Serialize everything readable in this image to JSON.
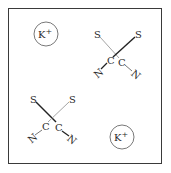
{
  "figure": {
    "frame": {
      "stroke": "#3a3a3a"
    },
    "ions": [
      {
        "label": "K",
        "charge": "+",
        "cx": 46,
        "cy": 34,
        "r": 12
      },
      {
        "label": "K",
        "charge": "+",
        "cx": 122,
        "cy": 137,
        "r": 12
      }
    ],
    "molecules": [
      {
        "name": "thiocyanate-top-right",
        "atoms": {
          "S_left": {
            "label": "S",
            "x": 97,
            "y": 34
          },
          "S_right": {
            "label": "S",
            "x": 138,
            "y": 34
          },
          "C_left": {
            "label": "C",
            "x": 110,
            "y": 60
          },
          "C_right": {
            "label": "C",
            "x": 121,
            "y": 62
          },
          "N_left": {
            "label": "N",
            "x": 98,
            "y": 73
          },
          "N_right": {
            "label": "N",
            "x": 136,
            "y": 74
          }
        }
      },
      {
        "name": "thiocyanate-bottom-left",
        "atoms": {
          "S_left": {
            "label": "S",
            "x": 33,
            "y": 99
          },
          "S_right": {
            "label": "S",
            "x": 72,
            "y": 99
          },
          "C_left": {
            "label": "C",
            "x": 45,
            "y": 126
          },
          "C_right": {
            "label": "C",
            "x": 58,
            "y": 127
          },
          "N_left": {
            "label": "N",
            "x": 32,
            "y": 138
          },
          "N_right": {
            "label": "N",
            "x": 72,
            "y": 139
          }
        }
      }
    ]
  }
}
